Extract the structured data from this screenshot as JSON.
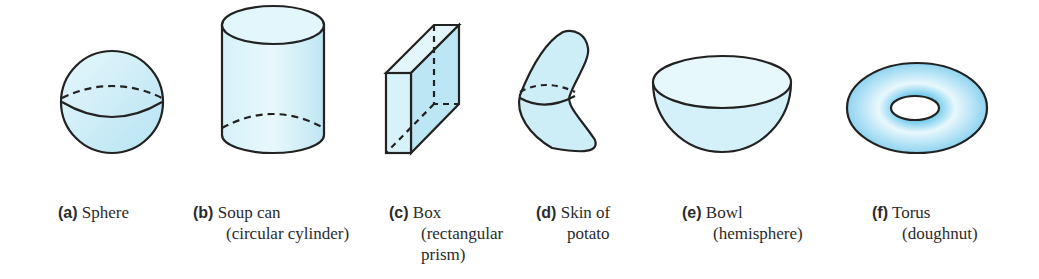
{
  "figure": {
    "fill_color": "#cdeef7",
    "stroke_color": "#222222",
    "items": [
      {
        "letter": "(a)",
        "line1": "Sphere",
        "line2": "",
        "line3": ""
      },
      {
        "letter": "(b)",
        "line1": "Soup can",
        "line2": "(circular cylinder)",
        "line3": ""
      },
      {
        "letter": "(c)",
        "line1": "Box",
        "line2": "(rectangular",
        "line3": "prism)"
      },
      {
        "letter": "(d)",
        "line1": "Skin of",
        "line2": "potato",
        "line3": ""
      },
      {
        "letter": "(e)",
        "line1": "Bowl",
        "line2": "(hemisphere)",
        "line3": ""
      },
      {
        "letter": "(f)",
        "line1": "Torus",
        "line2": "(doughnut)",
        "line3": ""
      }
    ]
  }
}
